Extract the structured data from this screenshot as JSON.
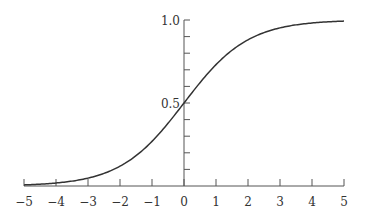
{
  "chart_data": {
    "type": "line",
    "title": "",
    "xlabel": "",
    "ylabel": "",
    "function": "logistic sigmoid 1/(1+e^-x)",
    "xlim": [
      -5,
      5
    ],
    "ylim": [
      0,
      1
    ],
    "grid": false,
    "legend": null,
    "x_ticks": [
      -5,
      -4,
      -3,
      -2,
      -1,
      0,
      1,
      2,
      3,
      4,
      5
    ],
    "x_tick_labels": [
      "−5",
      "−4",
      "−3",
      "−2",
      "−1",
      "0",
      "1",
      "2",
      "3",
      "4",
      "5"
    ],
    "y_ticks_minor": [
      0.1,
      0.2,
      0.3,
      0.4,
      0.5,
      0.6,
      0.7,
      0.8,
      0.9,
      1.0
    ],
    "y_tick_labels": [
      {
        "value": 0.5,
        "label": "0.5"
      },
      {
        "value": 1.0,
        "label": "1.0"
      }
    ],
    "series": [
      {
        "name": "sigmoid",
        "color": "#333333",
        "x": [
          -5,
          -4,
          -3,
          -2,
          -1,
          0,
          1,
          2,
          3,
          4,
          5
        ],
        "y": [
          0.007,
          0.018,
          0.047,
          0.119,
          0.269,
          0.5,
          0.731,
          0.881,
          0.953,
          0.982,
          0.993
        ]
      }
    ]
  }
}
